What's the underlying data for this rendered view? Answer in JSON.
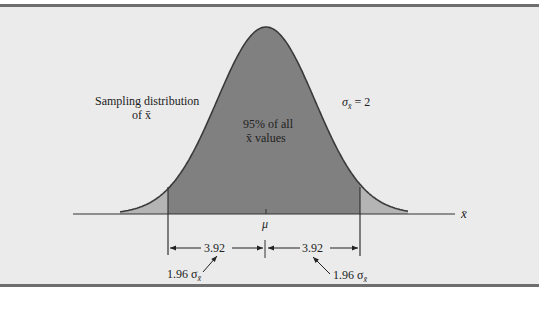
{
  "figure": {
    "type": "normal sampling distribution diagram",
    "colors": {
      "background": "#ebebeb",
      "border": "#6e6e6e",
      "center_fill": "#808080",
      "tail_fill": "#b4b4b4",
      "line": "#333333",
      "text": "#222222"
    }
  },
  "labels": {
    "sampling_distribution_line1": "Sampling distribution",
    "sampling_distribution_line2": "of x̄",
    "center_area_line1": "95% of all",
    "center_area_line2": "x̄ values",
    "sigma_label": "σ",
    "sigma_subscript": "x̄",
    "sigma_value": " = 2",
    "axis_label": "x̄",
    "mean_label": "μ",
    "left_width": "3.92",
    "right_width": "3.92",
    "left_multiplier": "1.96 σ",
    "left_multiplier_sub": "x̄",
    "right_multiplier": "1.96 σ",
    "right_multiplier_sub": "x̄"
  },
  "chart_data": {
    "type": "area",
    "title": "Sampling distribution of x̄",
    "distribution": "normal",
    "mean": "μ",
    "std_error": 2,
    "interval": {
      "z": 1.96,
      "half_width": 3.92,
      "coverage_percent": 95
    },
    "annotations": [
      "95% of all x̄ values",
      "σx̄ = 2",
      "3.92",
      "3.92",
      "1.96 σx̄",
      "1.96 σx̄"
    ],
    "xlabel": "x̄",
    "ylabel": ""
  }
}
